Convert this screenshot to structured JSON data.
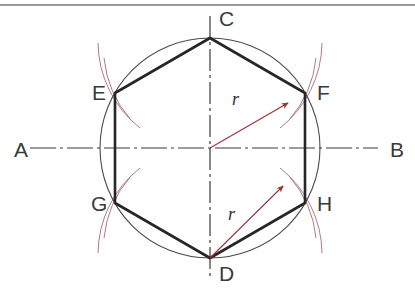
{
  "figure": {
    "background_color": "#ffffff",
    "border_color": "#9a9a9a"
  },
  "colors": {
    "construction_line": "#2e2e2e",
    "hexagon_stroke": "#262626",
    "circle_stroke": "#4a4a4a",
    "arc_stroke": "#b07a84",
    "radius_arrow": "#a03038",
    "centerline": "#3a3a3a",
    "label_text": "#3a3a3a"
  },
  "geometry": {
    "circle": {
      "cx": 210,
      "cy": 148,
      "r": 110
    },
    "hexagon_vertices": [
      {
        "id": "C",
        "x": 210,
        "y": 38
      },
      {
        "id": "F",
        "x": 305,
        "y": 93
      },
      {
        "id": "H",
        "x": 305,
        "y": 203
      },
      {
        "id": "D",
        "x": 210,
        "y": 258
      },
      {
        "id": "G",
        "x": 115,
        "y": 203
      },
      {
        "id": "E",
        "x": 115,
        "y": 93
      }
    ]
  },
  "labels": {
    "vertices": [
      {
        "name": "C",
        "text": "C",
        "x": 219,
        "y": 26
      },
      {
        "name": "F",
        "text": "F",
        "x": 317,
        "y": 100
      },
      {
        "name": "H",
        "text": "H",
        "x": 317,
        "y": 211
      },
      {
        "name": "D",
        "text": "D",
        "x": 219,
        "y": 281
      },
      {
        "name": "G",
        "text": "G",
        "x": 91,
        "y": 211
      },
      {
        "name": "E",
        "text": "E",
        "x": 92,
        "y": 100
      }
    ],
    "axis": [
      {
        "name": "A",
        "text": "A",
        "x": 14,
        "y": 157
      },
      {
        "name": "B",
        "text": "B",
        "x": 390,
        "y": 157
      }
    ],
    "radius": [
      {
        "name": "radius-upper",
        "text": "r",
        "x": 232,
        "y": 105
      },
      {
        "name": "radius-lower",
        "text": "r",
        "x": 228,
        "y": 220
      }
    ]
  },
  "centerlines": {
    "horizontal": {
      "label_start": "A",
      "label_end": "B",
      "y": 148,
      "x1": 30,
      "x2": 378
    },
    "vertical": {
      "x": 210,
      "y1": 16,
      "y2": 276
    }
  }
}
